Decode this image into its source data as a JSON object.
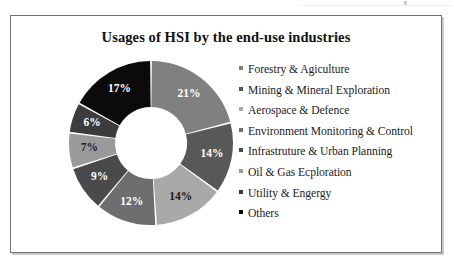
{
  "figure": {
    "title": "Usages of HSI by the end-use industries",
    "frame_border_color": "#6f7071",
    "background_color": "#ffffff"
  },
  "chart_data": {
    "type": "pie",
    "variant": "donut",
    "title": "Usages of HSI by the end-use industries",
    "xlabel": "",
    "ylabel": "",
    "legend_position": "right",
    "grid": false,
    "start_angle_deg": 0,
    "direction": "clockwise",
    "value_unit": "%",
    "categories": [
      "Forestry & Agiculture",
      "Mining & Mineral Exploration",
      "Aerospace & Defence",
      "Environment Monitoring & Control",
      "Infrastruture & Urban Planning",
      "Oil & Gas Ecploration",
      "Utility & Engergy",
      "Others"
    ],
    "values": [
      21,
      14,
      14,
      12,
      9,
      7,
      6,
      17
    ],
    "labels": [
      "21%",
      "14%",
      "14%",
      "12%",
      "9%",
      "7%",
      "6%",
      "17%"
    ],
    "colors": [
      "#808080",
      "#585858",
      "#a9a9a9",
      "#6e6e6e",
      "#4a4a4a",
      "#9a9a9a",
      "#3c3c3c",
      "#0b0b0b"
    ],
    "label_text_colors": [
      "#ffffff",
      "#ffffff",
      "#1a1a1a",
      "#ffffff",
      "#ffffff",
      "#1f1f1f",
      "#ffffff",
      "#ffffff"
    ],
    "separator_color": "#ffffff",
    "total": 100
  },
  "legend": {
    "items": [
      {
        "label": "Forestry & Agiculture",
        "color": "#808080"
      },
      {
        "label": "Mining & Mineral Exploration",
        "color": "#585858"
      },
      {
        "label": "Aerospace & Defence",
        "color": "#a9a9a9"
      },
      {
        "label": "Environment Monitoring & Control",
        "color": "#6e6e6e"
      },
      {
        "label": "Infrastruture & Urban Planning",
        "color": "#4a4a4a"
      },
      {
        "label": "Oil & Gas Ecploration",
        "color": "#9a9a9a"
      },
      {
        "label": "Utility & Engergy",
        "color": "#3c3c3c"
      },
      {
        "label": "Others",
        "color": "#0b0b0b"
      }
    ]
  }
}
